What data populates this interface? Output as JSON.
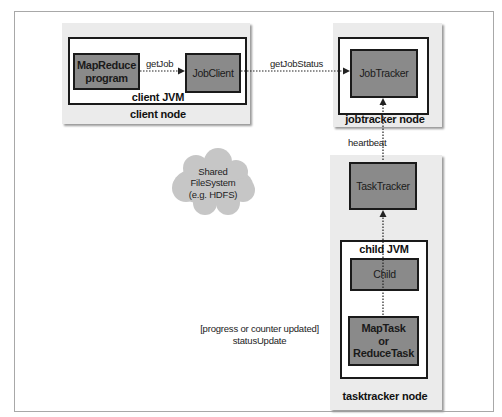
{
  "diagram": {
    "colors": {
      "node_bg": "#ebebeb",
      "component_fill": "#8a8a8a",
      "jvm_fill": "#ffffff",
      "border": "#1a1a1a",
      "cloud": "#c8c8c8"
    },
    "client_node": {
      "label": "client node",
      "jvm_label": "client JVM",
      "components": [
        {
          "id": "mapreduce-program",
          "label_lines": [
            "MapReduce",
            "program"
          ]
        },
        {
          "id": "jobclient",
          "label": "JobClient"
        }
      ]
    },
    "jobtracker_node": {
      "label": "jobtracker node",
      "component": "JobTracker"
    },
    "tasktracker_node": {
      "label": "tasktracker node",
      "component": "TaskTracker",
      "jvm_label": "child JVM",
      "child": "Child",
      "task_lines": [
        "MapTask",
        "or",
        "ReduceTask"
      ]
    },
    "shared_fs": {
      "lines": [
        "Shared",
        "FileSystem",
        "(e.g. HDFS)"
      ]
    },
    "edges": [
      {
        "from": "MapReduce program",
        "to": "JobClient",
        "label": "getJob"
      },
      {
        "from": "JobClient",
        "to": "JobTracker",
        "label": "getJobStatus"
      },
      {
        "from": "TaskTracker",
        "to": "JobTracker",
        "label": "heartbeat"
      },
      {
        "from": "Child",
        "to": "TaskTracker",
        "label": ""
      },
      {
        "from": "MapTask or ReduceTask",
        "to": "Child",
        "label_lines": [
          "[progress or counter updated]",
          "statusUpdate"
        ]
      }
    ]
  }
}
